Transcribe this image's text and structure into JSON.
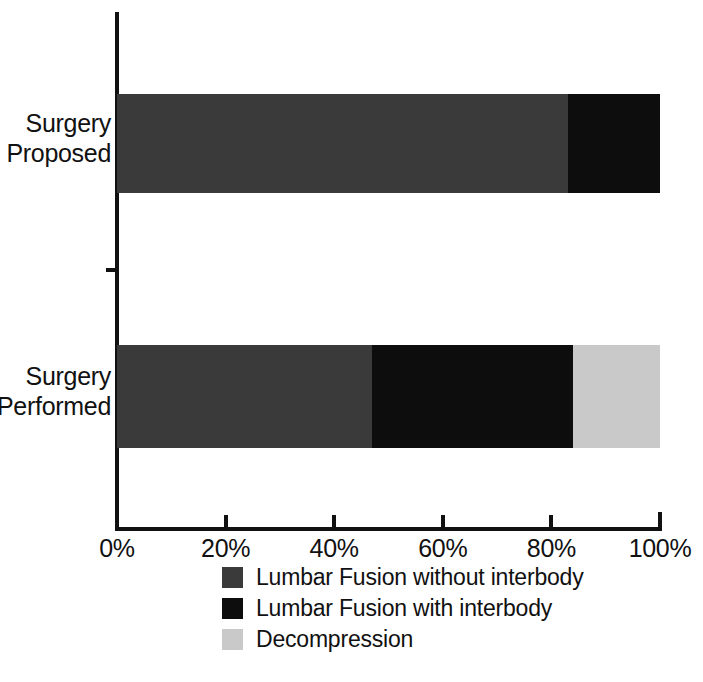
{
  "chart_data": {
    "type": "bar",
    "orientation": "horizontal",
    "stacked": true,
    "normalized": true,
    "title": "",
    "xlabel": "",
    "ylabel": "",
    "xlim": [
      0,
      100
    ],
    "grid": false,
    "legend_position": "bottom",
    "categories": [
      "Surgery Proposed",
      "Surgery Performed"
    ],
    "tick_labels": [
      "0%",
      "20%",
      "40%",
      "60%",
      "80%",
      "100%"
    ],
    "tick_values": [
      0,
      20,
      40,
      60,
      80,
      100
    ],
    "series": [
      {
        "name": "Lumbar Fusion without interbody",
        "color": "#3a3a3a",
        "values": [
          83,
          47
        ]
      },
      {
        "name": "Lumbar Fusion with interbody",
        "color": "#0d0d0d",
        "values": [
          17,
          37
        ]
      },
      {
        "name": "Decompression",
        "color": "#c9c9c9",
        "values": [
          0,
          16
        ]
      }
    ]
  },
  "axis": {
    "ticks": [
      {
        "label": "0%",
        "value": 0
      },
      {
        "label": "20%",
        "value": 20
      },
      {
        "label": "40%",
        "value": 40
      },
      {
        "label": "60%",
        "value": 60
      },
      {
        "label": "80%",
        "value": 80
      },
      {
        "label": "100%",
        "value": 100
      }
    ]
  },
  "categories": [
    {
      "label": "Surgery\nProposed"
    },
    {
      "label": "Surgery\nPerformed"
    }
  ],
  "legend": {
    "items": [
      {
        "label": "Lumbar Fusion without interbody",
        "color": "#3a3a3a"
      },
      {
        "label": "Lumbar Fusion with interbody",
        "color": "#0d0d0d"
      },
      {
        "label": "Decompression",
        "color": "#c9c9c9"
      }
    ]
  }
}
